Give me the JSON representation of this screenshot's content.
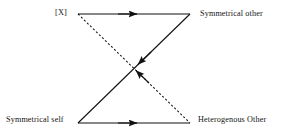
{
  "figure": {
    "type": "relational-diagram",
    "background_color": "#ffffff",
    "line_color": "#111111",
    "text_color": "#141414",
    "nodes": [
      {
        "id": "top_left",
        "label": "[X]",
        "x": 78,
        "y": 14
      },
      {
        "id": "top_right",
        "label": "Symmetrical other",
        "x": 190,
        "y": 14
      },
      {
        "id": "bottom_left",
        "label": "Symmetrical self",
        "x": 78,
        "y": 123
      },
      {
        "id": "bottom_right",
        "label": "Heterogenous Other",
        "x": 190,
        "y": 123
      }
    ],
    "edges": [
      {
        "id": "top-edge",
        "from": "top_left",
        "to": "top_right",
        "style": "solid",
        "arrow": "forward",
        "arrow_position": "midpoint",
        "arrow_direction": "right"
      },
      {
        "id": "bottom-edge",
        "from": "bottom_left",
        "to": "bottom_right",
        "style": "solid",
        "arrow": "forward",
        "arrow_position": "midpoint",
        "arrow_direction": "right"
      },
      {
        "id": "solid-diagonal",
        "from": "top_right",
        "to": "bottom_left",
        "style": "solid",
        "arrow": "forward",
        "arrow_position": "near-center",
        "arrow_direction": "down-left"
      },
      {
        "id": "dashed-diagonal",
        "from": "top_left",
        "to": "bottom_right",
        "style": "dashed",
        "arrow": "backward",
        "arrow_position": "near-center",
        "arrow_direction": "up-left"
      }
    ]
  }
}
